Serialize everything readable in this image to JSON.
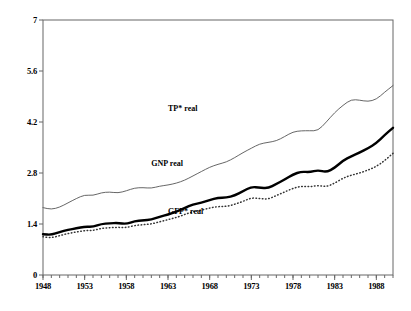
{
  "chart_data": {
    "type": "line",
    "title": "",
    "subtitle": "",
    "xlabel": "",
    "ylabel": "",
    "xlim": [
      1948,
      1990
    ],
    "ylim": [
      0,
      7
    ],
    "grid": false,
    "legend_position": "inline-annotations",
    "y_ticks": [
      "0",
      "1.4",
      "2.8",
      "4.2",
      "5.6",
      "7"
    ],
    "y_tick_values": [
      0,
      1.4,
      2.8,
      4.2,
      5.6,
      7
    ],
    "x_ticks": [
      "1948",
      "1953",
      "1958",
      "1963",
      "1968",
      "1973",
      "1978",
      "1983",
      "1988"
    ],
    "x_tick_values": [
      1948,
      1953,
      1958,
      1963,
      1968,
      1973,
      1978,
      1983,
      1988
    ],
    "x_minor_step": 1,
    "x": [
      1948,
      1949,
      1950,
      1951,
      1952,
      1953,
      1954,
      1955,
      1956,
      1957,
      1958,
      1959,
      1960,
      1961,
      1962,
      1963,
      1964,
      1965,
      1966,
      1967,
      1968,
      1969,
      1970,
      1971,
      1972,
      1973,
      1974,
      1975,
      1976,
      1977,
      1978,
      1979,
      1980,
      1981,
      1982,
      1983,
      1984,
      1985,
      1986,
      1987,
      1988,
      1989,
      1990
    ],
    "series": [
      {
        "name": "TP* real",
        "style": "thin-solid",
        "color": "#555555",
        "label_x": 1963,
        "label_y": 4.55,
        "values": [
          1.85,
          1.8,
          1.86,
          1.98,
          2.1,
          2.2,
          2.18,
          2.26,
          2.28,
          2.25,
          2.31,
          2.39,
          2.4,
          2.38,
          2.44,
          2.47,
          2.52,
          2.6,
          2.72,
          2.84,
          2.96,
          3.04,
          3.1,
          3.22,
          3.36,
          3.48,
          3.6,
          3.64,
          3.68,
          3.8,
          3.93,
          3.96,
          3.96,
          3.96,
          4.2,
          4.46,
          4.66,
          4.82,
          4.8,
          4.76,
          4.82,
          5.02,
          5.2
        ]
      },
      {
        "name": "GNP real",
        "style": "thick-solid",
        "color": "#000000",
        "label_x": 1961,
        "label_y": 3.05,
        "values": [
          1.12,
          1.1,
          1.18,
          1.24,
          1.28,
          1.33,
          1.32,
          1.4,
          1.42,
          1.43,
          1.4,
          1.48,
          1.5,
          1.52,
          1.6,
          1.66,
          1.74,
          1.84,
          1.94,
          1.98,
          2.06,
          2.12,
          2.12,
          2.18,
          2.3,
          2.42,
          2.4,
          2.38,
          2.5,
          2.62,
          2.76,
          2.84,
          2.82,
          2.88,
          2.82,
          2.94,
          3.14,
          3.26,
          3.36,
          3.48,
          3.62,
          3.84,
          4.04
        ]
      },
      {
        "name": "GFP* real",
        "style": "dotted",
        "color": "#333333",
        "label_x": 1963,
        "label_y": 1.72,
        "values": [
          1.05,
          1.02,
          1.08,
          1.14,
          1.18,
          1.22,
          1.22,
          1.28,
          1.3,
          1.31,
          1.3,
          1.36,
          1.38,
          1.4,
          1.46,
          1.52,
          1.58,
          1.66,
          1.74,
          1.78,
          1.84,
          1.88,
          1.88,
          1.94,
          2.02,
          2.12,
          2.1,
          2.08,
          2.18,
          2.28,
          2.38,
          2.44,
          2.42,
          2.46,
          2.42,
          2.52,
          2.66,
          2.74,
          2.8,
          2.88,
          2.98,
          3.14,
          3.34
        ]
      }
    ]
  },
  "axes": {
    "plot_left": 43,
    "plot_right": 393,
    "plot_top": 20,
    "plot_bottom": 275
  }
}
